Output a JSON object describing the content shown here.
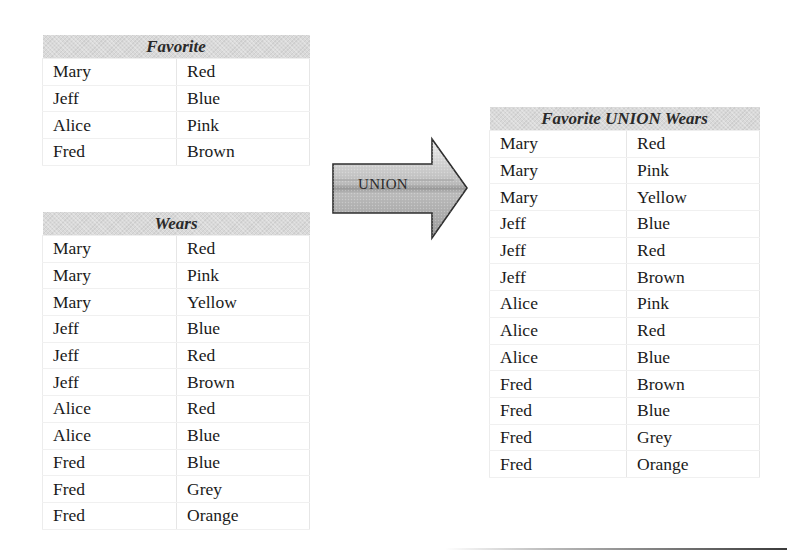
{
  "tables": {
    "favorite": {
      "title": "Favorite",
      "rows": [
        [
          "Mary",
          "Red"
        ],
        [
          "Jeff",
          "Blue"
        ],
        [
          "Alice",
          "Pink"
        ],
        [
          "Fred",
          "Brown"
        ]
      ]
    },
    "wears": {
      "title": "Wears",
      "rows": [
        [
          "Mary",
          "Red"
        ],
        [
          "Mary",
          "Pink"
        ],
        [
          "Mary",
          "Yellow"
        ],
        [
          "Jeff",
          "Blue"
        ],
        [
          "Jeff",
          "Red"
        ],
        [
          "Jeff",
          "Brown"
        ],
        [
          "Alice",
          "Red"
        ],
        [
          "Alice",
          "Blue"
        ],
        [
          "Fred",
          "Blue"
        ],
        [
          "Fred",
          "Grey"
        ],
        [
          "Fred",
          "Orange"
        ]
      ]
    },
    "union": {
      "title": "Favorite UNION Wears",
      "rows": [
        [
          "Mary",
          "Red"
        ],
        [
          "Mary",
          "Pink"
        ],
        [
          "Mary",
          "Yellow"
        ],
        [
          "Jeff",
          "Blue"
        ],
        [
          "Jeff",
          "Red"
        ],
        [
          "Jeff",
          "Brown"
        ],
        [
          "Alice",
          "Pink"
        ],
        [
          "Alice",
          "Red"
        ],
        [
          "Alice",
          "Blue"
        ],
        [
          "Fred",
          "Brown"
        ],
        [
          "Fred",
          "Blue"
        ],
        [
          "Fred",
          "Grey"
        ],
        [
          "Fred",
          "Orange"
        ]
      ]
    }
  },
  "arrow": {
    "label": "UNION",
    "icon": "right-arrow-icon"
  },
  "colors": {
    "header_bg": "#d9d9d9",
    "text": "#1a1a1a",
    "arrow_light": "#e6e6e6",
    "arrow_dark": "#8c8c8c"
  }
}
